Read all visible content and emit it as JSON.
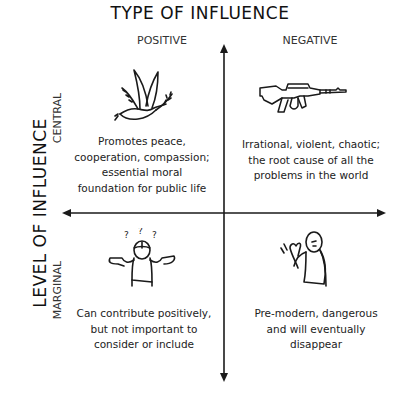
{
  "title": "TYPE OF INFLUENCE",
  "y_axis_title": "LEVEL OF INFLUENCE",
  "columns": [
    {
      "label": "POSITIVE"
    },
    {
      "label": "NEGATIVE"
    }
  ],
  "rows": [
    {
      "label": "CENTRAL"
    },
    {
      "label": "MARGINAL"
    }
  ],
  "quadrants": {
    "central_positive": {
      "icon": "dove-with-olive-branch-icon",
      "lines": [
        "Promotes peace,",
        "cooperation, compassion;",
        "essential moral",
        "foundation for public life"
      ]
    },
    "central_negative": {
      "icon": "assault-rifle-icon",
      "lines": [
        "Irrational, violent, chaotic;",
        "the root cause of all the",
        "problems in the world"
      ]
    },
    "marginal_positive": {
      "icon": "shrugging-person-icon",
      "lines": [
        "Can contribute positively,",
        "but not important to",
        "consider or include"
      ]
    },
    "marginal_negative": {
      "icon": "dismissive-waving-person-icon",
      "lines": [
        "Pre-modern, dangerous",
        "and will eventually",
        "disappear"
      ]
    }
  },
  "colors": {
    "ink": "#1a1a1a",
    "background": "#ffffff"
  }
}
